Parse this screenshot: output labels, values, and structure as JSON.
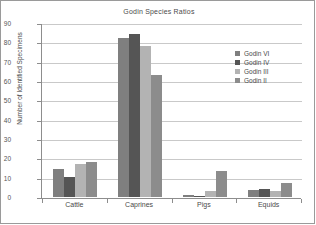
{
  "chart_data": {
    "type": "bar",
    "title": "Godin Species Ratios",
    "xlabel": "",
    "ylabel": "Number of Identified Specimens",
    "categories": [
      "Cattle",
      "Caprines",
      "Pigs",
      "Equids"
    ],
    "ylim": [
      0,
      90
    ],
    "yticks": [
      0,
      10,
      20,
      30,
      40,
      50,
      60,
      70,
      80,
      90
    ],
    "ytick_labels": [
      "0",
      "10",
      "20",
      "30",
      "40",
      "50",
      "60",
      "70",
      "80",
      "90"
    ],
    "grid": true,
    "legend_position": "upper right",
    "series": [
      {
        "name": "Godin VI",
        "color": "#7f7f7f",
        "values": [
          14.5,
          82.0,
          1.0,
          3.5
        ]
      },
      {
        "name": "Godin IV",
        "color": "#555555",
        "values": [
          10.5,
          84.5,
          0.3,
          4.0
        ]
      },
      {
        "name": "Godin III",
        "color": "#b3b3b3",
        "values": [
          17.0,
          78.0,
          3.0,
          3.0
        ]
      },
      {
        "name": "Godin II",
        "color": "#8c8c8c",
        "values": [
          18.0,
          63.0,
          13.5,
          7.0
        ]
      }
    ]
  }
}
